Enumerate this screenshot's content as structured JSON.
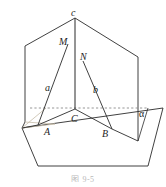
{
  "figure": {
    "caption": "图 9-5",
    "stroke_color": "#2b2b2b",
    "dashed_color": "#8a8a8a",
    "faint_color": "#c0b9a8",
    "background": "#ffffff",
    "labels": {
      "apex_line": "c",
      "point_M": "M",
      "point_N": "N",
      "segment_a": "a",
      "segment_b": "b",
      "point_C": "C",
      "point_A": "A",
      "point_B": "B",
      "plane_alpha": "α"
    },
    "geometry": {
      "description": "Dihedral-angle figure: two vertical half-planes meeting along edge c, intersecting a horizontal base plane alpha; triangle A-C-B in the base with apex lines a and b rising to the edge.",
      "points": {
        "c": [
          75,
          18
        ],
        "M": [
          68,
          44
        ],
        "N": [
          83,
          61
        ],
        "C": [
          75,
          109
        ],
        "A": [
          55,
          124
        ],
        "B": [
          97,
          126
        ],
        "left_plane_top_corner": [
          25,
          46
        ],
        "left_plane_bottom_corner": [
          25,
          122
        ],
        "right_plane_top_corner": [
          138,
          57
        ],
        "right_plane_bottom_corner": [
          138,
          141
        ],
        "base_left": [
          22,
          128
        ],
        "base_bottom_left": [
          38,
          166
        ],
        "base_bottom_right": [
          148,
          166
        ],
        "base_right": [
          163,
          108
        ]
      },
      "dashed_line": {
        "from": [
          30,
          108
        ],
        "to": [
          148,
          108
        ]
      },
      "vertical_edge": {
        "from": [
          75,
          18
        ],
        "to": [
          75,
          109
        ]
      }
    }
  }
}
